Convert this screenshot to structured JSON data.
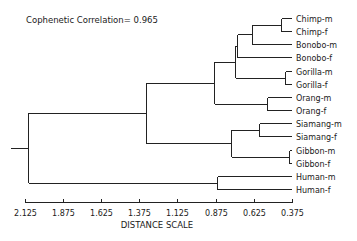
{
  "chart_data": {
    "type": "dendrogram",
    "title": "",
    "annotation": "Cophenetic Correlation= 0.965",
    "xlabel": "DISTANCE SCALE",
    "ylabel": "",
    "xlim": [
      2.125,
      0.375
    ],
    "x_ticks": [
      "2.125",
      "1.875",
      "1.625",
      "1.375",
      "1.125",
      "0.875",
      "0.625",
      "0.375"
    ],
    "x_tick_values": [
      2.125,
      1.875,
      1.625,
      1.375,
      1.125,
      0.875,
      0.625,
      0.375
    ],
    "grid": false,
    "leaves": [
      "Chimp-m",
      "Chimp-f",
      "Bonobo-m",
      "Bonobo-f",
      "Gorilla-m",
      "Gorilla-f",
      "Orang-m",
      "Orang-f",
      "Siamang-m",
      "Siamang-f",
      "Gibbon-m",
      "Gibbon-f",
      "Human-m",
      "Human-f"
    ],
    "merges": [
      {
        "id": "chimp",
        "children": [
          "Chimp-m",
          "Chimp-f"
        ],
        "distance": 0.445
      },
      {
        "id": "gorilla",
        "children": [
          "Gorilla-m",
          "Gorilla-f"
        ],
        "distance": 0.42
      },
      {
        "id": "orang",
        "children": [
          "Orang-m",
          "Orang-f"
        ],
        "distance": 0.54
      },
      {
        "id": "siamang",
        "children": [
          "Siamang-m",
          "Siamang-f"
        ],
        "distance": 0.59
      },
      {
        "id": "gibbon",
        "children": [
          "Gibbon-m",
          "Gibbon-f"
        ],
        "distance": 0.39
      },
      {
        "id": "human",
        "children": [
          "Human-m",
          "Human-f"
        ],
        "distance": 0.865
      },
      {
        "id": "chimp_bonobom",
        "children": [
          "chimp",
          "Bonobo-m"
        ],
        "distance": 0.635
      },
      {
        "id": "pan",
        "children": [
          "chimp_bonobom",
          "Bonobo-f"
        ],
        "distance": 0.735
      },
      {
        "id": "african",
        "children": [
          "pan",
          "gorilla"
        ],
        "distance": 0.75
      },
      {
        "id": "great_apes",
        "children": [
          "african",
          "orang"
        ],
        "distance": 0.885
      },
      {
        "id": "lesser_apes",
        "children": [
          "siamang",
          "gibbon"
        ],
        "distance": 0.775
      },
      {
        "id": "apes",
        "children": [
          "great_apes",
          "lesser_apes"
        ],
        "distance": 1.33
      },
      {
        "id": "root",
        "children": [
          "apes",
          "human"
        ],
        "distance": 2.105
      }
    ]
  }
}
